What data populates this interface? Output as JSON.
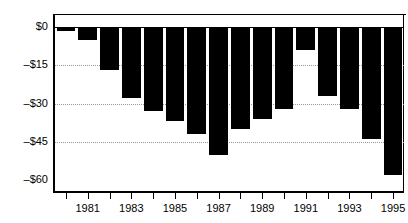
{
  "chart_data": {
    "type": "bar",
    "title": "",
    "subtitle": "",
    "xlabel": "",
    "ylabel": "",
    "categories": [
      "1980",
      "1981",
      "1982",
      "1983",
      "1984",
      "1985",
      "1986",
      "1987",
      "1988",
      "1989",
      "1990",
      "1991",
      "1992",
      "1993",
      "1994",
      "1995"
    ],
    "values": [
      -1.5,
      -5,
      -17,
      -28,
      -33,
      -37,
      -42,
      -50,
      -40,
      -36,
      -32,
      -9,
      -27,
      -32,
      -44,
      -58
    ],
    "ylim": [
      -60,
      0
    ],
    "ytick_values": [
      0,
      -15,
      -30,
      -45,
      -60
    ],
    "ytick_labels": [
      "$0",
      "–$15",
      "–$30",
      "–$45",
      "–$60"
    ],
    "xtick_labels_shown": [
      "1981",
      "1983",
      "1985",
      "1987",
      "1989",
      "1991",
      "1993",
      "1995"
    ],
    "grid": true,
    "grid_axis": "y",
    "grid_style": "dotted",
    "legend": null,
    "bar_color": "#000000",
    "axis_color": "#000000",
    "grid_color": "#999999",
    "background_color": "#ffffff"
  }
}
